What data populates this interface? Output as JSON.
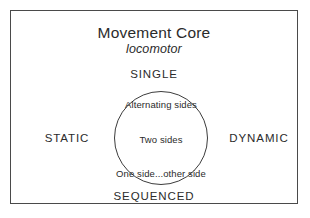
{
  "diagram": {
    "title": "Movement Core",
    "subtitle": "locomotor",
    "poles": {
      "top": "SINGLE",
      "bottom": "SEQUENCED",
      "left": "STATIC",
      "right": "DYNAMIC"
    },
    "core_items": [
      "Alternating sides",
      "Two sides",
      "One side...other side"
    ],
    "colors": {
      "background": "#ffffff",
      "frame_stroke": "#4a4a4a",
      "circle_stroke": "#3c3c3c",
      "text": "#2b2b2b"
    }
  }
}
